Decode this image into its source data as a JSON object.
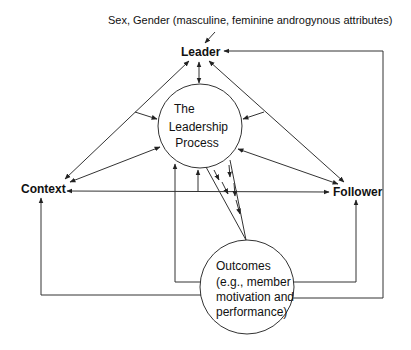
{
  "diagram": {
    "annotation": "Sex, Gender (masculine, feminine androgynous attributes)",
    "nodes": {
      "leader": "Leader",
      "context": "Context",
      "follower": "Follower"
    },
    "process_circle": {
      "lines": [
        "The",
        "Leadership",
        "Process"
      ]
    },
    "outcomes_circle": {
      "lines": [
        "Outcomes",
        "(e.g., member",
        "motivation and",
        "performance)"
      ]
    },
    "colors": {
      "line": "#333333",
      "text": "#111111",
      "background": "#ffffff"
    }
  }
}
